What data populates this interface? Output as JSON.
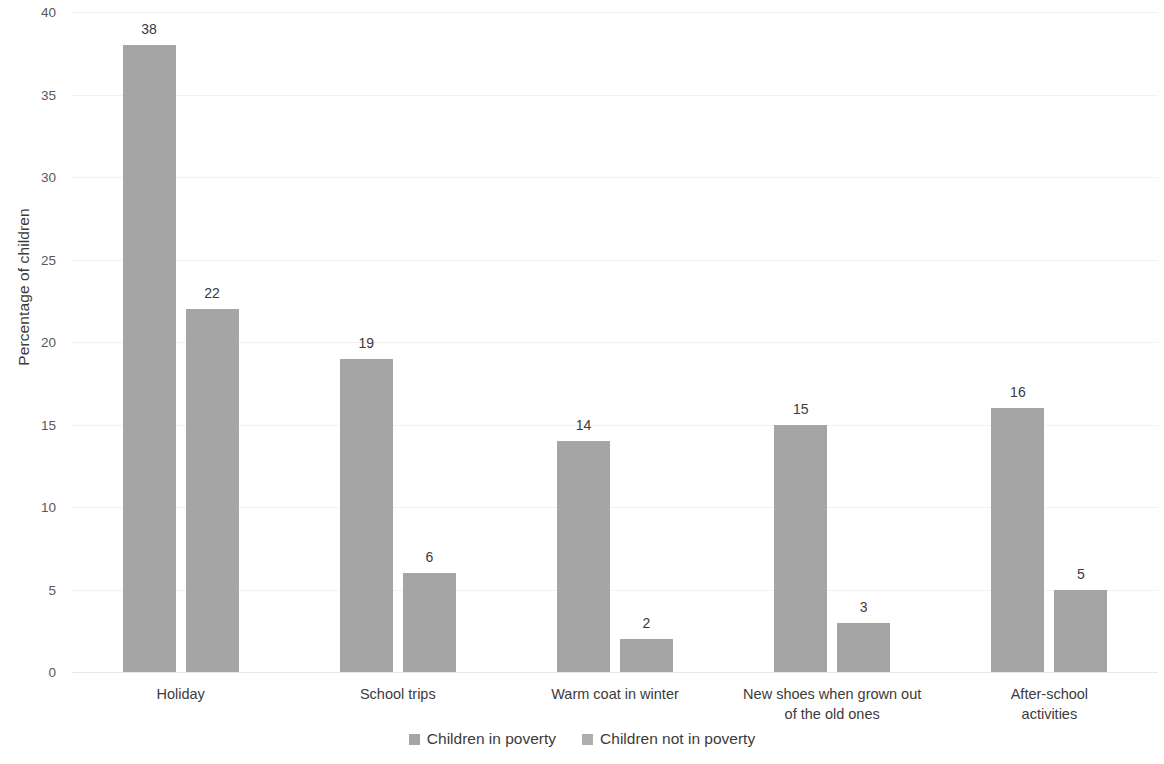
{
  "chart_data": {
    "type": "bar",
    "title": "",
    "subtitle": "",
    "xlabel": "",
    "ylabel": "Percentage of children",
    "ylim": [
      0,
      40
    ],
    "yticks": [
      0,
      5,
      10,
      15,
      20,
      25,
      30,
      35,
      40
    ],
    "ytick_labels": [
      "0",
      "5",
      "10",
      "15",
      "20",
      "25",
      "30",
      "35",
      "40"
    ],
    "grid": true,
    "legend_position": "bottom",
    "categories": [
      "Holiday",
      "School trips",
      "Warm coat in winter",
      "New shoes when grown out\nof the old ones",
      "After-school activities"
    ],
    "series": [
      {
        "name": "Children in poverty",
        "color": "#a5a5a5",
        "values": [
          38,
          19,
          14,
          15,
          16
        ],
        "value_labels": [
          "38",
          "19",
          "14",
          "15",
          "16"
        ]
      },
      {
        "name": "Children not in poverty",
        "color": "#a5a5a5",
        "values": [
          22,
          6,
          2,
          3,
          5
        ],
        "value_labels": [
          "22",
          "6",
          "2",
          "3",
          "5"
        ]
      }
    ]
  },
  "legend": {
    "items": [
      {
        "label": "Children in poverty",
        "color": "#a5a5a5"
      },
      {
        "label": "Children not in poverty",
        "color": "#aeaeae"
      }
    ]
  }
}
